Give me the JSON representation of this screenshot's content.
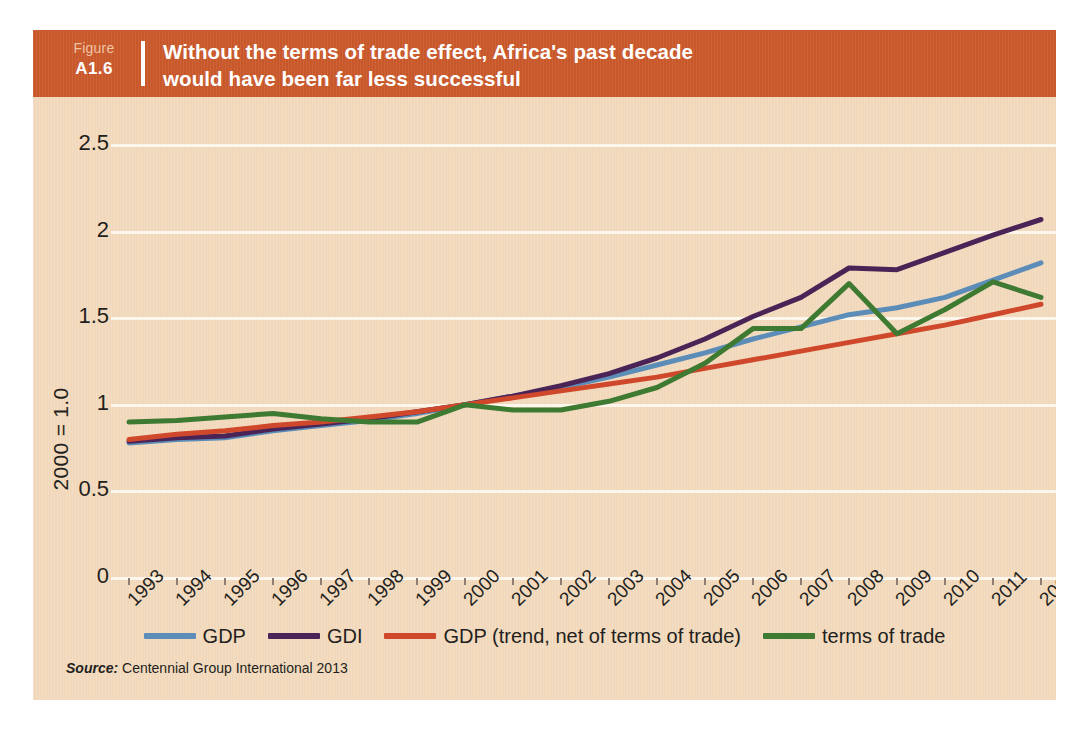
{
  "figure": {
    "tag_word": "Figure",
    "tag_number": "A1.6",
    "title_line1": "Without the terms of trade effect, Africa's past decade",
    "title_line2": "would have been far less successful",
    "source_word": "Source:",
    "source_text": "Centennial Group International 2013",
    "header_color": "#c8572a",
    "panel_color": "#f1d8ba"
  },
  "chart_data": {
    "type": "line",
    "title": "Without the terms of trade effect, Africa's past decade would have been far less successful",
    "xlabel": "",
    "ylabel": "2000 = 1.0",
    "ylim": [
      0,
      2.5
    ],
    "yticks": [
      0,
      0.5,
      1,
      1.5,
      2,
      2.5
    ],
    "ytick_labels": [
      "0",
      "0.5",
      "1",
      "1.5",
      "2",
      "2.5"
    ],
    "grid": true,
    "legend_position": "bottom",
    "x": [
      1993,
      1994,
      1995,
      1996,
      1997,
      1998,
      1999,
      2000,
      2001,
      2002,
      2003,
      2004,
      2005,
      2006,
      2007,
      2008,
      2009,
      2010,
      2011,
      2012
    ],
    "xtick_labels": [
      "1993",
      "1994",
      "1995",
      "1996",
      "1997",
      "1998",
      "1999",
      "2000",
      "2001",
      "2002",
      "2003",
      "2004",
      "2005",
      "2006",
      "2007",
      "2008",
      "2009",
      "2010",
      "2011",
      "2012"
    ],
    "series": [
      {
        "name": "GDP",
        "color": "#5b8db8",
        "values": [
          0.78,
          0.8,
          0.81,
          0.85,
          0.88,
          0.91,
          0.95,
          1.0,
          1.05,
          1.1,
          1.16,
          1.23,
          1.3,
          1.38,
          1.45,
          1.52,
          1.56,
          1.62,
          1.72,
          1.82
        ]
      },
      {
        "name": "GDI",
        "color": "#4a2456",
        "values": [
          0.79,
          0.81,
          0.82,
          0.86,
          0.89,
          0.92,
          0.96,
          1.0,
          1.05,
          1.11,
          1.18,
          1.27,
          1.38,
          1.51,
          1.62,
          1.79,
          1.78,
          1.88,
          1.98,
          2.07
        ]
      },
      {
        "name": "GDP (trend, net of terms of trade)",
        "color": "#d0482c",
        "values": [
          0.8,
          0.83,
          0.85,
          0.88,
          0.9,
          0.93,
          0.96,
          1.0,
          1.04,
          1.08,
          1.12,
          1.16,
          1.21,
          1.26,
          1.31,
          1.36,
          1.41,
          1.46,
          1.52,
          1.58
        ]
      },
      {
        "name": "terms of trade",
        "color": "#3f7a33",
        "values": [
          0.9,
          0.91,
          0.93,
          0.95,
          0.92,
          0.9,
          0.9,
          1.0,
          0.97,
          0.97,
          1.02,
          1.1,
          1.24,
          1.44,
          1.44,
          1.7,
          1.41,
          1.55,
          1.71,
          1.62
        ]
      }
    ],
    "legend": [
      {
        "label": "GDP",
        "color": "#5b8db8"
      },
      {
        "label": "GDI",
        "color": "#4a2456"
      },
      {
        "label": "GDP (trend, net of terms of trade)",
        "color": "#d0482c"
      },
      {
        "label": "terms of trade",
        "color": "#3f7a33"
      }
    ]
  }
}
